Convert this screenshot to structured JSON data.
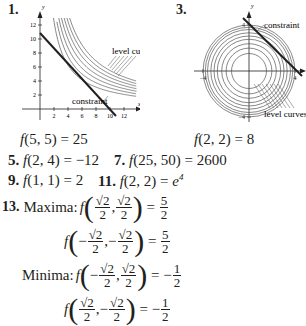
{
  "problems": {
    "p1": {
      "number": "1.",
      "graph": {
        "x_ticks": [
          "2",
          "4",
          "6",
          "8",
          "10",
          "12"
        ],
        "y_ticks": [
          "2",
          "4",
          "6",
          "8",
          "10",
          "12"
        ],
        "x_axis_label": "x",
        "y_axis_label": "y",
        "label_level_curves": "level curves",
        "label_constraint": "constraint"
      },
      "answer_func": "f",
      "answer_args": "(5, 5)",
      "answer_eq": " = 25"
    },
    "p3": {
      "number": "3.",
      "graph": {
        "x_ticks": [
          "−4",
          "4"
        ],
        "y_ticks": [
          "4",
          "−4"
        ],
        "x_axis_label": "x",
        "y_axis_label": "y",
        "label_level_curves": "level curves",
        "label_constraint": "constraint"
      },
      "answer_func": "f",
      "answer_args": "(2, 2)",
      "answer_eq": " = 8"
    },
    "p5": {
      "number": "5.",
      "func": "f",
      "args": "(2, 4)",
      "eq": " = −12"
    },
    "p7": {
      "number": "7.",
      "func": "f",
      "args": "(25, 50)",
      "eq": " = 2600"
    },
    "p9": {
      "number": "9.",
      "func": "f",
      "args": "(1, 1)",
      "eq": " = 2"
    },
    "p11": {
      "number": "11.",
      "func": "f",
      "args": "(2, 2)",
      "eq": " = ",
      "base": "e",
      "exp": "4"
    },
    "p13": {
      "number": "13.",
      "maxima_label": "Maxima:",
      "minima_label": "Minima:",
      "func": "f",
      "sqrt2": "√2",
      "radicand": "2",
      "den": "2",
      "minus": "−",
      "comma": ",",
      "equals": "=",
      "five": "5",
      "one": "1",
      "two": "2"
    }
  }
}
